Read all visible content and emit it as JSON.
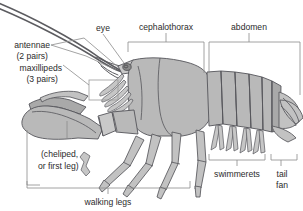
{
  "figure": {
    "background_color": "#ffffff",
    "line_color": "#8c8c8c",
    "body_color": "#b9b9b9",
    "outline_color": "#55555a",
    "text_color": "#2b2b2b"
  },
  "labels": {
    "eye": "eye",
    "cephalothorax": "cephalothorax",
    "abdomen": "abdomen",
    "antennae_line1": "antennae",
    "antennae_line2": "(2 pairs)",
    "maxillipeds_line1": "maxillipeds",
    "maxillipeds_line2": "(3 pairs)",
    "cheliped_line1": "(cheliped,",
    "cheliped_line2": "or first leg)",
    "walking_legs": "walking legs",
    "swimmerets": "swimmerets",
    "tail_line1": "tail",
    "tail_line2": "fan"
  },
  "icons": {
    "eye_marker": "eye-dot-icon",
    "maxilliped_callout": "callout-rectangle-icon"
  }
}
